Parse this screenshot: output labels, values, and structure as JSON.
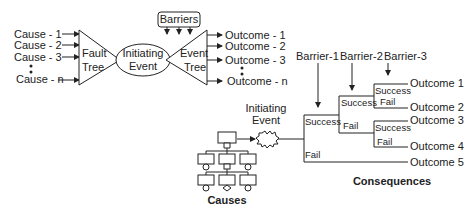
{
  "bowtie": {
    "causes": [
      "Cause - 1",
      "Cause - 2",
      "Cause - 3",
      "Cause - n"
    ],
    "fault_tree": [
      "Fault",
      "Tree"
    ],
    "initiating_event": [
      "Initiating",
      "Event"
    ],
    "event_tree": [
      "Event",
      "Tree"
    ],
    "barriers": "Barriers",
    "outcomes": [
      "Outcome - 1",
      "Outcome - 2",
      "Outcome - 3",
      "Outcome - n"
    ]
  },
  "event_tree_detail": {
    "barriers": [
      "Barrier-1",
      "Barrier-2",
      "Barrier-3"
    ],
    "initiating_event": [
      "Initiating",
      "Event"
    ],
    "success_label": "Success",
    "fail_label": "Fail",
    "outcomes": [
      "Outcome 1",
      "Outcome 2",
      "Outcome 3",
      "Outcome 4",
      "Outcome 5"
    ],
    "causes_caption": "Causes",
    "consequences_caption": "Consequences"
  }
}
